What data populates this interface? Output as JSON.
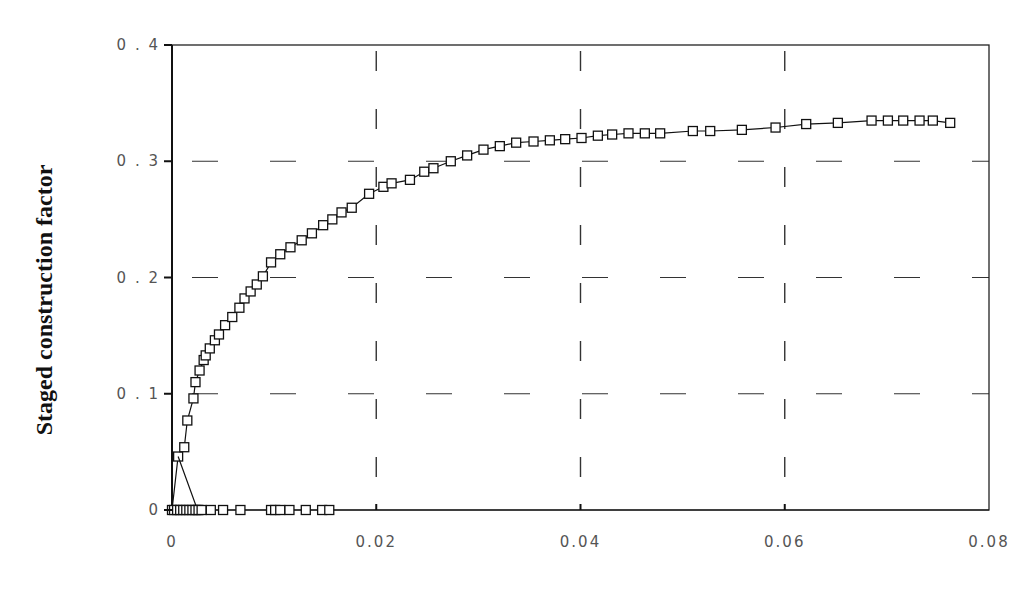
{
  "chart_data": {
    "type": "line",
    "title": "",
    "xlabel": "",
    "ylabel": "Staged construction factor",
    "xlim": [
      0,
      0.08
    ],
    "ylim": [
      0,
      0.4
    ],
    "x_ticks": [
      "0",
      "0.02",
      "0.04",
      "0.06",
      "0.08"
    ],
    "y_ticks": [
      "0",
      "0.1",
      "0.2",
      "0.3",
      "0.4"
    ],
    "grid": true,
    "grid_style": "dashed",
    "legend": null,
    "marker": "square",
    "series": [
      {
        "name": "loading curve",
        "points": [
          [
            0,
            0
          ],
          [
            0.0006,
            0.046
          ],
          [
            0.0012,
            0.054
          ],
          [
            0.0015,
            0.077
          ],
          [
            0.0021,
            0.096
          ],
          [
            0.0023,
            0.11
          ],
          [
            0.0027,
            0.12
          ],
          [
            0.0031,
            0.129
          ],
          [
            0.0033,
            0.133
          ],
          [
            0.0037,
            0.139
          ],
          [
            0.0042,
            0.146
          ],
          [
            0.0046,
            0.151
          ],
          [
            0.0052,
            0.159
          ],
          [
            0.0059,
            0.166
          ],
          [
            0.0066,
            0.174
          ],
          [
            0.0071,
            0.182
          ],
          [
            0.0077,
            0.188
          ],
          [
            0.0083,
            0.194
          ],
          [
            0.0089,
            0.201
          ],
          [
            0.0097,
            0.213
          ],
          [
            0.0106,
            0.22
          ],
          [
            0.0116,
            0.226
          ],
          [
            0.0127,
            0.232
          ],
          [
            0.0137,
            0.238
          ],
          [
            0.0148,
            0.245
          ],
          [
            0.0157,
            0.25
          ],
          [
            0.0166,
            0.256
          ],
          [
            0.0176,
            0.26
          ],
          [
            0.0193,
            0.272
          ],
          [
            0.0207,
            0.278
          ],
          [
            0.0215,
            0.281
          ],
          [
            0.0233,
            0.284
          ],
          [
            0.0247,
            0.291
          ],
          [
            0.0256,
            0.294
          ],
          [
            0.0273,
            0.3
          ],
          [
            0.0289,
            0.305
          ],
          [
            0.0305,
            0.31
          ],
          [
            0.0321,
            0.313
          ],
          [
            0.0337,
            0.316
          ],
          [
            0.0354,
            0.317
          ],
          [
            0.037,
            0.318
          ],
          [
            0.0385,
            0.319
          ],
          [
            0.0401,
            0.32
          ],
          [
            0.0417,
            0.322
          ],
          [
            0.0431,
            0.323
          ],
          [
            0.0447,
            0.324
          ],
          [
            0.0463,
            0.324
          ],
          [
            0.0478,
            0.324
          ],
          [
            0.051,
            0.326
          ],
          [
            0.0527,
            0.326
          ],
          [
            0.0558,
            0.327
          ],
          [
            0.0591,
            0.329
          ],
          [
            0.0621,
            0.332
          ],
          [
            0.0652,
            0.333
          ],
          [
            0.0685,
            0.335
          ],
          [
            0.0701,
            0.335
          ],
          [
            0.0716,
            0.335
          ],
          [
            0.0732,
            0.335
          ],
          [
            0.0745,
            0.335
          ],
          [
            0.0762,
            0.333
          ]
        ]
      },
      {
        "name": "unloading curve",
        "points": [
          [
            0.0006,
            0.046
          ],
          [
            0.0025,
            0
          ],
          [
            0.0002,
            0
          ],
          [
            0.0005,
            0
          ],
          [
            0.0008,
            0
          ],
          [
            0.0011,
            0
          ],
          [
            0.0014,
            0
          ],
          [
            0.0017,
            0
          ],
          [
            0.002,
            0
          ],
          [
            0.0023,
            0
          ],
          [
            0.0026,
            0
          ],
          [
            0.0029,
            0
          ],
          [
            0.0038,
            0
          ],
          [
            0.005,
            0
          ],
          [
            0.0067,
            0
          ],
          [
            0.0097,
            0
          ],
          [
            0.0101,
            0
          ],
          [
            0.0106,
            0
          ],
          [
            0.0115,
            0
          ],
          [
            0.0131,
            0
          ],
          [
            0.0147,
            0
          ],
          [
            0.0154,
            0
          ],
          [
            0.08,
            0
          ]
        ]
      }
    ]
  },
  "plot": {
    "left": 172,
    "right": 989,
    "top": 45,
    "bottom": 510
  }
}
